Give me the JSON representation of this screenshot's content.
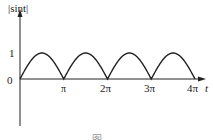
{
  "chart_data": {
    "type": "line",
    "title": "",
    "ylabel": "|sint|",
    "xlabel": "t",
    "function": "|sin t|",
    "x_ticks": [
      "π",
      "2π",
      "3π",
      "4π"
    ],
    "y_ticks": [
      "0",
      "1"
    ],
    "xlim": [
      0,
      "4π"
    ],
    "ylim": [
      0,
      1
    ],
    "grid": false,
    "x": [
      0,
      0.785,
      1.571,
      2.356,
      3.142,
      3.927,
      4.712,
      5.498,
      6.283,
      7.069,
      7.854,
      8.639,
      9.425,
      10.21,
      10.996,
      11.781,
      12.566
    ],
    "values": [
      0,
      0.707,
      1,
      0.707,
      0,
      0.707,
      1,
      0.707,
      0,
      0.707,
      1,
      0.707,
      0,
      0.707,
      1,
      0.707,
      0
    ]
  },
  "labels": {
    "y_axis": "|sint|",
    "x_axis": "t",
    "y1": "1",
    "y0": "0",
    "xpi": "π",
    "x2pi": "2π",
    "x3pi": "3π",
    "x4pi": "4π",
    "caption": "图"
  }
}
